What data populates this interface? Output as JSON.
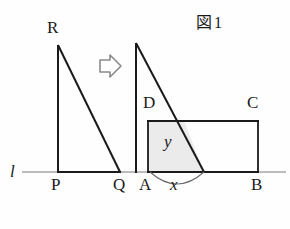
{
  "figure": {
    "caption_kanji": "図",
    "caption_number": "1",
    "line_label": "l",
    "colors": {
      "stroke": "#1a1a1a",
      "baseline": "#6e6e6e",
      "shade_fill": "#ebebeb",
      "arrow_stroke": "#8a8a8a",
      "background": "#fefefe"
    },
    "left_triangle": {
      "name": "triangle-PQR",
      "vertices": {
        "R": {
          "label": "R",
          "x": 58,
          "y": 45
        },
        "P": {
          "label": "P",
          "x": 58,
          "y": 172
        },
        "Q": {
          "label": "Q",
          "x": 120,
          "y": 172
        }
      }
    },
    "move_arrow": {
      "name": "right-arrow-icon",
      "direction": "right"
    },
    "right_triangle": {
      "name": "triangle-moved",
      "apex": {
        "x": 136,
        "y": 43
      },
      "foot_left": {
        "x": 136,
        "y": 172
      },
      "foot_right": {
        "x": 204,
        "y": 172
      }
    },
    "rectangle": {
      "name": "rectangle-ABCD",
      "vertices": {
        "A": {
          "label": "A",
          "x": 148,
          "y": 172
        },
        "B": {
          "label": "B",
          "x": 258,
          "y": 172
        },
        "C": {
          "label": "C",
          "x": 258,
          "y": 121
        },
        "D": {
          "label": "D",
          "x": 148,
          "y": 121
        }
      }
    },
    "overlap_region": {
      "name": "overlap-area",
      "label": "y",
      "shape": "trapezoid"
    },
    "distance_marker": {
      "name": "distance-x",
      "label": "x",
      "from": "A",
      "to": "triangle-foot-right"
    }
  }
}
